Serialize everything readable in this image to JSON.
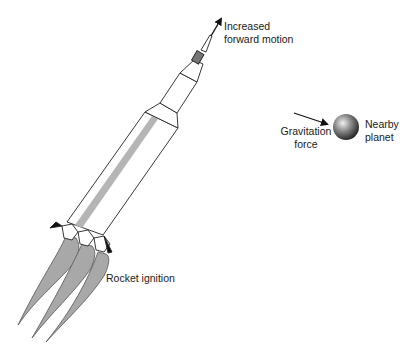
{
  "diagram": {
    "labels": {
      "forward_motion": "Increased\nforward motion",
      "gravitation_force": "Gravitation\nforce",
      "nearby_planet": "Nearby\nplanet",
      "rocket_ignition": "Rocket ignition"
    },
    "colors": {
      "outline": "#222222",
      "flame_fill": "#a8a8a8",
      "body_stripe": "#b5b5b5",
      "fin_fill": "#111111",
      "background": "#ffffff"
    }
  }
}
